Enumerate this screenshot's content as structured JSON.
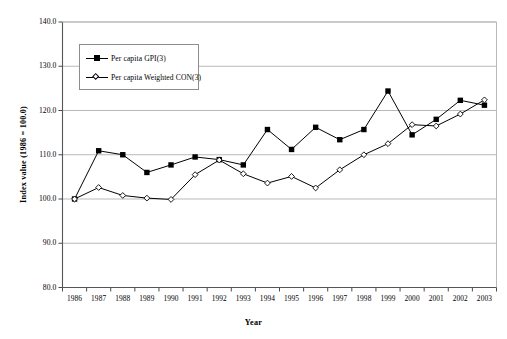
{
  "chart_data": {
    "type": "line",
    "title": "",
    "xlabel": "Year",
    "ylabel": "Index value (1986 = 100.0)",
    "categories": [
      "1986",
      "1987",
      "1988",
      "1989",
      "1990",
      "1991",
      "1992",
      "1993",
      "1994",
      "1995",
      "1996",
      "1997",
      "1998",
      "1999",
      "2000",
      "2001",
      "2002",
      "2003"
    ],
    "ylim": [
      80.0,
      140.0
    ],
    "yticks": [
      "80.0",
      "90.0",
      "100.0",
      "110.0",
      "120.0",
      "130.0",
      "140.0"
    ],
    "ytick_values": [
      80.0,
      90.0,
      100.0,
      110.0,
      120.0,
      130.0,
      140.0
    ],
    "grid": "horizontal",
    "legend_position": "upper-left-inside",
    "series": [
      {
        "name": "Per capita GPI(3)",
        "marker": "filled-square",
        "color": "#000000",
        "values": [
          100.0,
          110.9,
          110.0,
          106.0,
          107.7,
          109.5,
          108.9,
          107.7,
          115.7,
          111.2,
          116.2,
          113.4,
          115.7,
          124.4,
          114.5,
          118.0,
          122.3,
          121.2
        ]
      },
      {
        "name": "Per capita Weighted CON(3)",
        "marker": "open-diamond",
        "color": "#000000",
        "values": [
          100.0,
          102.6,
          100.8,
          100.2,
          99.9,
          105.5,
          108.8,
          105.7,
          103.6,
          105.1,
          102.5,
          106.6,
          110.0,
          112.5,
          116.8,
          116.5,
          119.2,
          122.4
        ]
      }
    ]
  },
  "legend": {
    "items": [
      {
        "label": "Per capita GPI(3)",
        "marker": "filled-square"
      },
      {
        "label": "Per capita Weighted CON(3)",
        "marker": "open-diamond"
      }
    ]
  },
  "axes": {
    "y_title": "Index value (1986 = 100.0)",
    "x_title": "Year"
  }
}
